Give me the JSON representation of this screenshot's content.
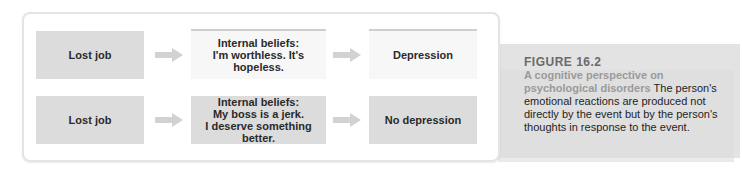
{
  "diagram": {
    "rows": [
      {
        "event": "Lost job",
        "beliefs": [
          "Internal beliefs:",
          "I'm worthless. It's hopeless."
        ],
        "outcome": "Depression"
      },
      {
        "event": "Lost job",
        "beliefs": [
          "Internal beliefs:",
          "My boss is a jerk.",
          "I deserve something better."
        ],
        "outcome": "No depression"
      }
    ],
    "arrow_icon": "right-arrow-icon"
  },
  "caption": {
    "figure_number": "FIGURE 16.2",
    "title": "A cognitive perspective on psychological disorders",
    "body": "The person's emotional reactions are produced not directly by the event but by the person's thoughts in response to the event."
  },
  "colors": {
    "box_gray": "#dcdcdc",
    "box_light": "#f7f7f7",
    "arrow": "#d2d2d2",
    "caption_band": "#e3e3e3",
    "figure_number": "#6a6a6a",
    "figure_title": "#9a9a9a"
  }
}
